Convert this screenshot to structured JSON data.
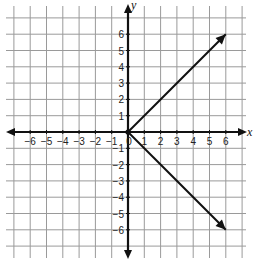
{
  "chart_data": {
    "type": "line",
    "title": "",
    "xlabel": "x",
    "ylabel": "y",
    "xlim": [
      -7,
      7
    ],
    "ylim": [
      -7,
      7
    ],
    "grid": true,
    "x_ticks": [
      "-6",
      "-5",
      "-4",
      "-3",
      "-2",
      "-1",
      "0",
      "1",
      "2",
      "3",
      "4",
      "5",
      "6"
    ],
    "y_ticks": [
      "6",
      "5",
      "4",
      "3",
      "2",
      "1",
      "-1",
      "-2",
      "-3",
      "-4",
      "-5",
      "-6"
    ],
    "series": [
      {
        "name": "upper ray",
        "points": [
          [
            0,
            0
          ],
          [
            6,
            6
          ]
        ],
        "arrow_end": true
      },
      {
        "name": "lower ray",
        "points": [
          [
            0,
            0
          ],
          [
            6,
            -6
          ]
        ],
        "arrow_end": true
      }
    ],
    "origin_point": [
      0,
      0
    ]
  },
  "labels": {
    "x_axis": "x",
    "y_axis": "y",
    "origin": "0"
  },
  "colors": {
    "grid": "#9a9a9a",
    "axis": "#111111",
    "line": "#111111"
  }
}
